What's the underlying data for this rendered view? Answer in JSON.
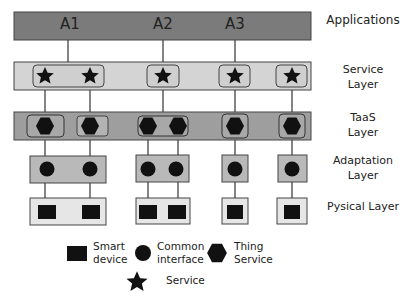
{
  "diagram": {
    "layers": [
      {
        "id": "applications",
        "label": "Applications"
      },
      {
        "id": "service",
        "label": "Service\nLayer",
        "line1": "Service",
        "line2": "Layer"
      },
      {
        "id": "taas",
        "label": "TaaS\nLayer",
        "line1": "TaaS",
        "line2": "Layer"
      },
      {
        "id": "adaptation",
        "label": "Adaptation\nLayer",
        "line1": "Adaptation",
        "line2": "Layer"
      },
      {
        "id": "physical",
        "label": "Pysical Layer"
      }
    ],
    "applications": [
      {
        "label": "A1"
      },
      {
        "label": "A2"
      },
      {
        "label": "A3"
      }
    ],
    "columns": 6,
    "groups": [
      {
        "app": "A1",
        "services": 2,
        "thing_services": 2,
        "interfaces": 2,
        "devices": 2
      },
      {
        "app": "A2",
        "services": 1,
        "thing_services": 2,
        "interfaces": 2,
        "devices": 2
      },
      {
        "app": "A3",
        "services": 1,
        "thing_services": 1,
        "interfaces": 1,
        "devices": 1
      },
      {
        "app": null,
        "services": 1,
        "thing_services": 1,
        "interfaces": 1,
        "devices": 1
      }
    ],
    "legend": {
      "smart_device": {
        "line1": "Smart",
        "line2": "device",
        "icon": "filled-square-icon"
      },
      "common_interface": {
        "line1": "Common",
        "line2": "interface",
        "icon": "filled-circle-icon"
      },
      "thing_service": {
        "line1": "Thing",
        "line2": "Service",
        "icon": "filled-hexagon-icon"
      },
      "service": {
        "label": "Service",
        "icon": "filled-star-icon"
      }
    },
    "colors": {
      "applications_fill": "#7b7b7b",
      "service_fill": "#d4d4d4",
      "taas_fill": "#9e9e9e",
      "adaptation_fill": "#b9b9b9",
      "physical_fill": "#e6e6e6",
      "shape_fill": "#111111",
      "stroke": "#3a3a3a"
    }
  }
}
